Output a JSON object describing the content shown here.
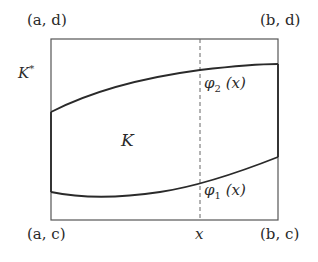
{
  "diagram": {
    "type": "region-between-curves",
    "rectangle": {
      "corners": {
        "top_left": "(a, d)",
        "top_right": "(b, d)",
        "bottom_left": "(a, c)",
        "bottom_right": "(b, c)"
      },
      "label": "K*",
      "label_base": "K",
      "label_sup": "*"
    },
    "region": {
      "label": "K"
    },
    "curves": {
      "upper": {
        "label": "φ₂ (x)",
        "func": "φ",
        "sub": "2",
        "arg": "(x)"
      },
      "lower": {
        "label": "φ₁ (x)",
        "func": "φ",
        "sub": "1",
        "arg": "(x)"
      }
    },
    "vertical_line": {
      "label": "x",
      "style": "dashed"
    },
    "colors": {
      "stroke": "#2a2a2a",
      "rect_stroke": "#555555",
      "dashed": "#666666"
    }
  }
}
